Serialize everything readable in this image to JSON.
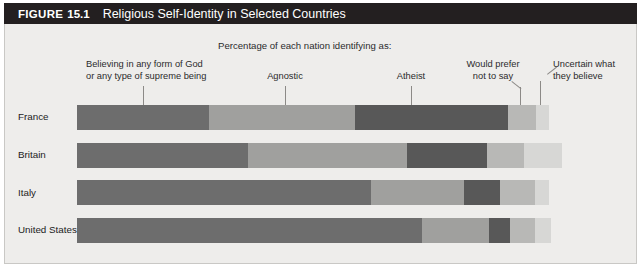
{
  "figure": {
    "label_word": "FIGURE",
    "number": "15.1",
    "title": "Religious Self-Identity in Selected Countries",
    "subtitle": "Percentage of each nation identifying as:"
  },
  "annotations": {
    "believing_line1": "Believing in any form of God",
    "believing_line2": "or any type of supreme being",
    "agnostic": "Agnostic",
    "atheist": "Atheist",
    "prefer_line1": "Would prefer",
    "prefer_line2": "not to say",
    "uncertain_line1": "Uncertain what",
    "uncertain_line2": "they believe"
  },
  "colors": {
    "believing": "#6d6d6d",
    "agnostic": "#a0a09e",
    "atheist": "#585858",
    "prefer": "#b8b8b6",
    "uncertain": "#d7d7d5",
    "title_bar": "#231f20",
    "panel": "#eeedeb"
  },
  "chart_data": {
    "type": "bar",
    "orientation": "horizontal",
    "stacked": true,
    "title": "Religious Self-Identity in Selected Countries",
    "subtitle": "Percentage of each nation identifying as:",
    "xlabel": "",
    "ylabel": "",
    "xlim": [
      0,
      100
    ],
    "grid": false,
    "legend_position": "callout-labels-above-bars",
    "categories": [
      "France",
      "Britain",
      "Italy",
      "United States"
    ],
    "series": [
      {
        "name": "Believing in any form of God or any type of supreme being",
        "color": "#6d6d6d",
        "values": [
          28,
          36,
          62,
          73
        ]
      },
      {
        "name": "Agnostic",
        "color": "#a0a09e",
        "values": [
          31,
          34,
          20,
          14
        ]
      },
      {
        "name": "Atheist",
        "color": "#585858",
        "values": [
          32,
          17,
          8,
          4
        ]
      },
      {
        "name": "Would prefer not to say",
        "color": "#b8b8b6",
        "values": [
          6,
          8,
          7,
          5
        ]
      },
      {
        "name": "Uncertain what they believe",
        "color": "#d7d7d5",
        "values": [
          3,
          5,
          3,
          4
        ]
      }
    ]
  },
  "rows": [
    {
      "label": "France",
      "segments": [
        {
          "key": "believing",
          "width_px": 132
        },
        {
          "key": "agnostic",
          "width_px": 146
        },
        {
          "key": "atheist",
          "width_px": 153
        },
        {
          "key": "prefer",
          "width_px": 28
        },
        {
          "key": "uncertain",
          "width_px": 13
        }
      ]
    },
    {
      "label": "Britain",
      "segments": [
        {
          "key": "believing",
          "width_px": 171
        },
        {
          "key": "agnostic",
          "width_px": 159
        },
        {
          "key": "atheist",
          "width_px": 80
        },
        {
          "key": "prefer",
          "width_px": 37
        },
        {
          "key": "uncertain",
          "width_px": 38
        }
      ]
    },
    {
      "label": "Italy",
      "segments": [
        {
          "key": "believing",
          "width_px": 294
        },
        {
          "key": "agnostic",
          "width_px": 93
        },
        {
          "key": "atheist",
          "width_px": 36
        },
        {
          "key": "prefer",
          "width_px": 35
        },
        {
          "key": "uncertain",
          "width_px": 14
        }
      ]
    },
    {
      "label": "United States",
      "segments": [
        {
          "key": "believing",
          "width_px": 345
        },
        {
          "key": "agnostic",
          "width_px": 67
        },
        {
          "key": "atheist",
          "width_px": 21
        },
        {
          "key": "prefer",
          "width_px": 25
        },
        {
          "key": "uncertain",
          "width_px": 16
        }
      ]
    }
  ]
}
